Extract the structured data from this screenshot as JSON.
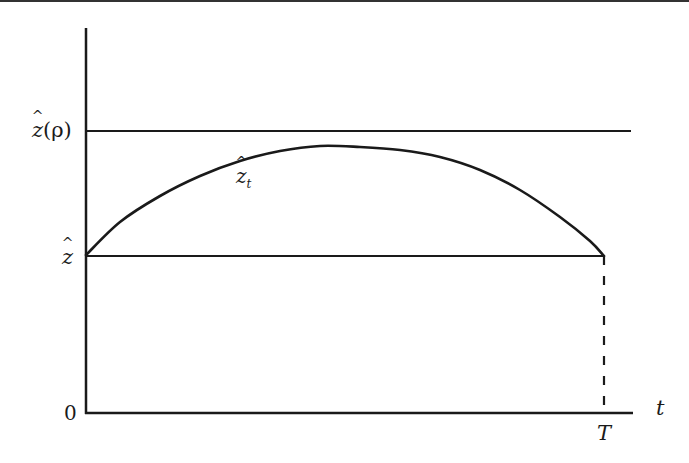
{
  "diagram": {
    "type": "time-path plot",
    "top_border": true,
    "axes": {
      "y_axis": {
        "x": 86,
        "y_top": 28,
        "y_bottom": 413
      },
      "x_axis": {
        "y": 413,
        "x_left": 86,
        "x_right": 633,
        "label": "t"
      },
      "origin_label": "0"
    },
    "levels": [
      {
        "name": "z-hat-rho",
        "label_base": "z",
        "label_arg": "(ρ)",
        "y": 131,
        "x_end": 631
      },
      {
        "name": "z-hat",
        "label_base": "z",
        "y": 256,
        "x_end": 604
      }
    ],
    "curve": {
      "label_base": "z",
      "label_sub": "t",
      "points": [
        [
          86,
          255
        ],
        [
          120,
          222
        ],
        [
          160,
          196
        ],
        [
          200,
          176
        ],
        [
          240,
          161
        ],
        [
          280,
          151
        ],
        [
          320,
          146
        ],
        [
          360,
          147
        ],
        [
          400,
          150
        ],
        [
          440,
          157
        ],
        [
          480,
          170
        ],
        [
          520,
          190
        ],
        [
          560,
          217
        ],
        [
          590,
          241
        ],
        [
          604,
          256
        ]
      ]
    },
    "terminal": {
      "label": "T",
      "x": 604,
      "dashed_from_y": 256,
      "dashed_to_y": 413
    }
  },
  "labels": {
    "z_rho_base": "z",
    "z_rho_arg": "(ρ)",
    "z_base": "z",
    "zt_base": "z",
    "zt_sub": "t",
    "zero": "0",
    "t_axis": "t",
    "T": "T"
  },
  "colors": {
    "stroke": "#1a1a1a",
    "background": "#ffffff"
  }
}
